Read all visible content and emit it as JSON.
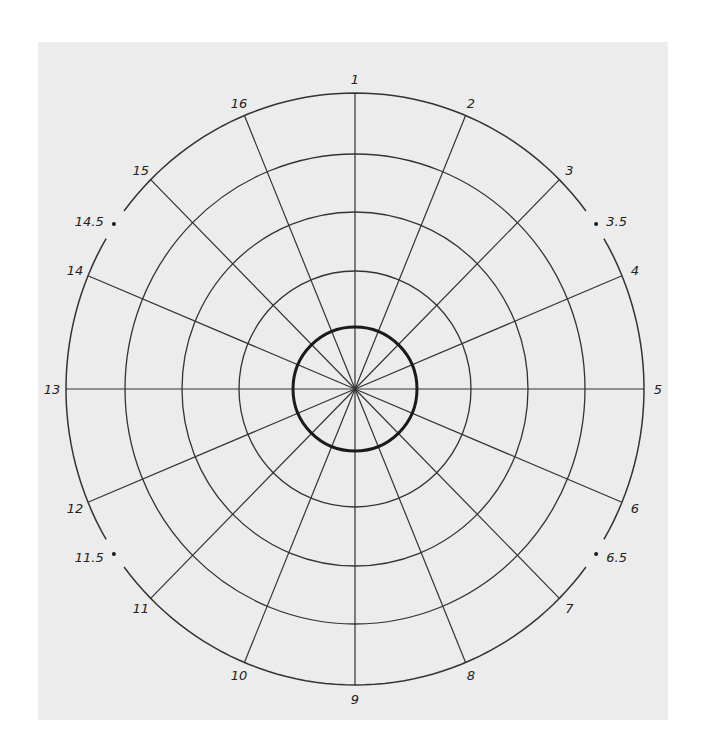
{
  "diagram": {
    "type": "polar-grid",
    "center": [
      355,
      389
    ],
    "outer_radius": [
      289,
      296
    ],
    "ring_radii": [
      [
        116,
        118
      ],
      [
        173,
        177
      ],
      [
        230,
        235
      ]
    ],
    "inner_bold_radius": [
      62,
      62
    ],
    "spoke_count": 16,
    "colors": {
      "background": "#ececec",
      "line": "#333333",
      "bold": "#1a1a1a"
    },
    "labels": [
      {
        "text": "1",
        "angle": 0
      },
      {
        "text": "2",
        "angle": 22.5
      },
      {
        "text": "3",
        "angle": 45
      },
      {
        "text": "4",
        "angle": 67.5
      },
      {
        "text": "5",
        "angle": 90
      },
      {
        "text": "6",
        "angle": 112.5
      },
      {
        "text": "7",
        "angle": 135
      },
      {
        "text": "8",
        "angle": 157.5
      },
      {
        "text": "9",
        "angle": 180
      },
      {
        "text": "10",
        "angle": 202.5
      },
      {
        "text": "11",
        "angle": 225
      },
      {
        "text": "12",
        "angle": 247.5
      },
      {
        "text": "13",
        "angle": 270
      },
      {
        "text": "14",
        "angle": 292.5
      },
      {
        "text": "15",
        "angle": 315
      },
      {
        "text": "16",
        "angle": 337.5
      }
    ],
    "half_marks": [
      {
        "text": "3.5",
        "angle": 56.25
      },
      {
        "text": "6.5",
        "angle": 123.75
      },
      {
        "text": "11.5",
        "angle": 236.25
      },
      {
        "text": "14.5",
        "angle": 303.75
      }
    ]
  }
}
